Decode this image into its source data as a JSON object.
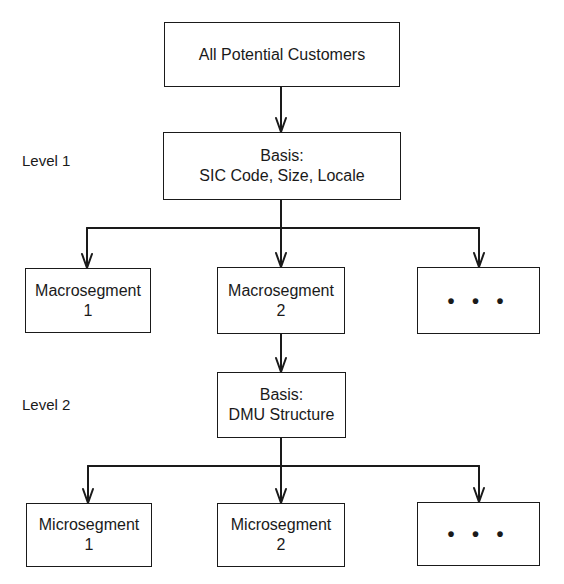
{
  "diagram": {
    "type": "hierarchy",
    "nodes": {
      "root": {
        "label": "All Potential Customers"
      },
      "basis1": {
        "line1": "Basis:",
        "line2": "SIC Code, Size, Locale"
      },
      "macro1": {
        "line1": "Macrosegment",
        "line2": "1"
      },
      "macro2": {
        "line1": "Macrosegment",
        "line2": "2"
      },
      "macro_more": {
        "label": "• • •"
      },
      "basis2": {
        "line1": "Basis:",
        "line2": "DMU Structure"
      },
      "micro1": {
        "line1": "Microsegment",
        "line2": "1"
      },
      "micro2": {
        "line1": "Microsegment",
        "line2": "2"
      },
      "micro_more": {
        "label": "• • •"
      }
    },
    "levels": [
      {
        "label": "Level 1"
      },
      {
        "label": "Level 2"
      }
    ],
    "edges": [
      [
        "root",
        "basis1"
      ],
      [
        "basis1",
        "macro1"
      ],
      [
        "basis1",
        "macro2"
      ],
      [
        "basis1",
        "macro_more"
      ],
      [
        "macro2",
        "basis2"
      ],
      [
        "basis2",
        "micro1"
      ],
      [
        "basis2",
        "micro2"
      ],
      [
        "basis2",
        "micro_more"
      ]
    ],
    "line_color": "#1a1a1a"
  }
}
